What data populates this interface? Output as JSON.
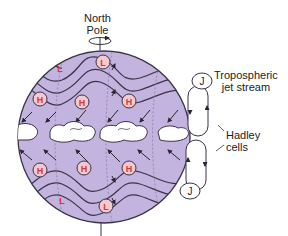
{
  "labels": {
    "north_pole_line1": "North",
    "north_pole_line2": "Pole",
    "jet_stream_line1": "Tropospheric",
    "jet_stream_line2": "jet stream",
    "hadley_line1": "Hadley",
    "hadley_line2": "cells"
  },
  "markers": {
    "high": "H",
    "low": "L",
    "jet": "J"
  },
  "colors": {
    "globe_fill": "#c2b3df",
    "outline": "#3a3346",
    "pressure_marker": "#d43b3b",
    "marker_fill": "#f3c9cf",
    "cloud": "#ffffff"
  }
}
